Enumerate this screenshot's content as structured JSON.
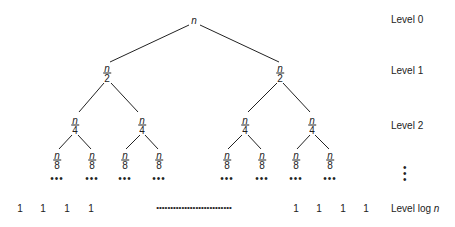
{
  "diagram": {
    "root": {
      "label": "n"
    },
    "level1": [
      {
        "num": "n",
        "den": "2"
      },
      {
        "num": "n",
        "den": "2"
      }
    ],
    "level2": [
      {
        "num": "n",
        "den": "4"
      },
      {
        "num": "n",
        "den": "4"
      },
      {
        "num": "n",
        "den": "4"
      },
      {
        "num": "n",
        "den": "4"
      }
    ],
    "level3": [
      {
        "num": "n",
        "den": "8"
      },
      {
        "num": "n",
        "den": "8"
      },
      {
        "num": "n",
        "den": "8"
      },
      {
        "num": "n",
        "den": "8"
      },
      {
        "num": "n",
        "den": "8"
      },
      {
        "num": "n",
        "den": "8"
      },
      {
        "num": "n",
        "den": "8"
      },
      {
        "num": "n",
        "den": "8"
      }
    ],
    "ellipsis": "•••",
    "vertical_ellipsis": "•\n•\n•",
    "leaf": "1",
    "leaf_row_dots": "•••••••••••••••••••••••••••",
    "levels": [
      "Level 0",
      "Level 1",
      "Level 2",
      "Level log n"
    ],
    "level_log_prefix": "Level log ",
    "level_log_var": "n"
  }
}
